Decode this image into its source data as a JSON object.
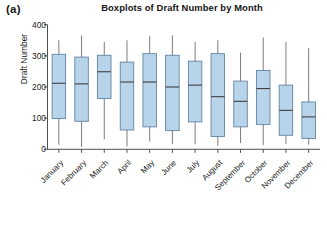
{
  "panel": {
    "label": "(a)"
  },
  "chart_data": {
    "type": "box",
    "title": "Boxplots of Draft Number by Month",
    "xlabel": "",
    "ylabel": "Draft Number",
    "ylim": [
      0,
      400
    ],
    "yticks": [
      0,
      100,
      200,
      300,
      400
    ],
    "grid": false,
    "legend": "none",
    "categories": [
      "January",
      "February",
      "March",
      "April",
      "May",
      "June",
      "July",
      "August",
      "September",
      "October",
      "November",
      "December"
    ],
    "box_color": "#b8d4ea",
    "line_color": "#3c3c3c",
    "boxes": [
      {
        "category": "January",
        "whisker_low": 15,
        "q1": 99,
        "median": 212,
        "q3": 305,
        "whisker_high": 350
      },
      {
        "category": "February",
        "whisker_low": 8,
        "q1": 90,
        "median": 210,
        "q3": 296,
        "whisker_high": 365
      },
      {
        "category": "March",
        "whisker_low": 32,
        "q1": 163,
        "median": 249,
        "q3": 302,
        "whisker_high": 345
      },
      {
        "category": "April",
        "whisker_low": 9,
        "q1": 62,
        "median": 216,
        "q3": 280,
        "whisker_high": 350
      },
      {
        "category": "May",
        "whisker_low": 25,
        "q1": 72,
        "median": 216,
        "q3": 307,
        "whisker_high": 363
      },
      {
        "category": "June",
        "whisker_low": 17,
        "q1": 60,
        "median": 200,
        "q3": 302,
        "whisker_high": 366
      },
      {
        "category": "July",
        "whisker_low": 16,
        "q1": 88,
        "median": 206,
        "q3": 283,
        "whisker_high": 345
      },
      {
        "category": "August",
        "whisker_low": 12,
        "q1": 41,
        "median": 169,
        "q3": 307,
        "whisker_high": 350
      },
      {
        "category": "September",
        "whisker_low": 20,
        "q1": 72,
        "median": 154,
        "q3": 219,
        "whisker_high": 310
      },
      {
        "category": "October",
        "whisker_low": 13,
        "q1": 80,
        "median": 195,
        "q3": 253,
        "whisker_high": 359
      },
      {
        "category": "November",
        "whisker_low": 17,
        "q1": 45,
        "median": 125,
        "q3": 206,
        "whisker_high": 345
      },
      {
        "category": "December",
        "whisker_low": 15,
        "q1": 35,
        "median": 104,
        "q3": 152,
        "whisker_high": 325
      }
    ]
  }
}
